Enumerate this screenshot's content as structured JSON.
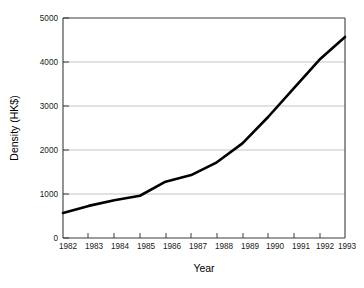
{
  "chart_data": {
    "type": "line",
    "title": "",
    "xlabel": "Year",
    "ylabel": "Density (HK$)",
    "x": [
      1982,
      1983,
      1984,
      1985,
      1986,
      1987,
      1988,
      1989,
      1990,
      1991,
      1992,
      1993
    ],
    "values": [
      570,
      730,
      860,
      960,
      1280,
      1430,
      1720,
      2150,
      2750,
      3400,
      4050,
      4570
    ],
    "series": [
      {
        "name": "Density (HK$)",
        "values": [
          570,
          730,
          860,
          960,
          1280,
          1430,
          1720,
          2150,
          2750,
          3400,
          4050,
          4570
        ]
      }
    ],
    "xlim": [
      1982,
      1993
    ],
    "ylim": [
      0,
      5000
    ],
    "xticks": [
      "1982",
      "1983",
      "1984",
      "1985",
      "1986",
      "1987",
      "1988",
      "1989",
      "1990",
      "1991",
      "1992",
      "1993"
    ],
    "yticks": [
      "0",
      "1000",
      "2000",
      "3000",
      "4000",
      "5000"
    ],
    "grid": "horizontal",
    "legend": "none",
    "line_color": "#000000",
    "grid_color": "#b4b4b4",
    "axis_color": "#3c3c3c",
    "background_color": "#ffffff"
  },
  "axes": {
    "y_axis_title": "Density (HK$)",
    "x_axis_title": "Year"
  }
}
